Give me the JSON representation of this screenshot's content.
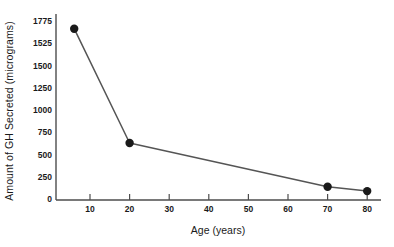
{
  "chart_data": {
    "type": "line",
    "title": "",
    "xlabel": "Age (years)",
    "ylabel": "Amount of GH Secreted (micrograms)",
    "x": [
      6,
      20,
      70,
      80
    ],
    "values": [
      1700,
      640,
      150,
      100
    ],
    "series": [
      {
        "name": "GH secreted",
        "points": [
          {
            "x": 6,
            "y": 1700
          },
          {
            "x": 20,
            "y": 640
          },
          {
            "x": 70,
            "y": 150
          },
          {
            "x": 80,
            "y": 100
          }
        ]
      }
    ],
    "xticks": [
      10,
      20,
      30,
      40,
      50,
      60,
      70,
      80
    ],
    "yticks": [
      1775,
      1525,
      1500,
      1250,
      1000,
      750,
      500,
      250,
      0
    ],
    "xlim": [
      0,
      84
    ],
    "ylim": [
      0,
      1775
    ],
    "grid": false,
    "legend": "none",
    "marker": "circle",
    "line_color": "#555555",
    "marker_color": "#1a1a1a",
    "axis_color": "#4d4d4d",
    "background": "#ffffff"
  },
  "axes": {
    "x_title": "Age (years)",
    "y_title": "Amount of GH Secreted (micrograms)"
  }
}
